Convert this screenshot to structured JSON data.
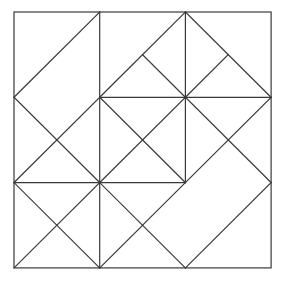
{
  "diagram": {
    "title": "",
    "stroke_color": "#3a3a3a",
    "background": "#ffffff",
    "origin_px": [
      14,
      12
    ],
    "unit_px": [
      85.7,
      85.3
    ],
    "outer_square": [
      0,
      0,
      3,
      3
    ],
    "segments": [
      [
        1,
        0,
        1,
        3
      ],
      [
        2,
        0,
        2,
        2
      ],
      [
        1,
        1,
        3,
        1
      ],
      [
        0,
        2,
        2,
        2
      ],
      [
        0,
        1,
        1,
        0
      ],
      [
        0,
        1,
        1,
        2
      ],
      [
        1,
        1,
        0,
        2
      ],
      [
        0,
        2,
        1,
        3
      ],
      [
        1,
        2,
        0,
        3
      ],
      [
        1,
        1,
        2,
        0
      ],
      [
        2,
        0,
        3,
        1
      ],
      [
        1.5,
        0.5,
        2,
        1
      ],
      [
        2.5,
        0.5,
        2,
        1
      ],
      [
        1,
        1,
        2,
        2
      ],
      [
        2,
        1,
        1,
        2
      ],
      [
        2,
        1,
        3,
        2
      ],
      [
        3,
        1,
        1.5,
        2.5
      ],
      [
        3,
        2,
        2,
        3
      ],
      [
        1,
        2,
        2,
        3
      ],
      [
        1.5,
        2.5,
        1,
        3
      ]
    ]
  }
}
